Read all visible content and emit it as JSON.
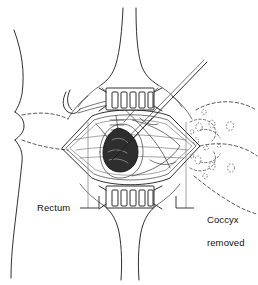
{
  "figure": {
    "domain": "medical-line-drawing",
    "background_color": "#ffffff",
    "line_color": "#1a1a1a",
    "mass_fill_color": "#2e2e2e",
    "dashed_line_color": "#2a2a2a",
    "width": 258,
    "height": 285
  },
  "labels": {
    "rectum": {
      "text": "Rectum",
      "position": "lower-left",
      "leader": "L-shaped leader from text up-right to the dark rectal mass"
    },
    "coccyx_removed": {
      "line1": "Coccyx",
      "line2": "removed",
      "text": "Coccyx removed",
      "position": "lower-right",
      "leader": "L-shaped leader from text up-left to the right side of the incision"
    }
  },
  "anatomy": {
    "body_outline": "left buttock and flank silhouette",
    "gluteal_cleft_upper": "natal cleft descending from top center",
    "gluteal_cleft_lower": "natal cleft continuing below the wound",
    "skin_crease_lines": "two dashed horizontal gluteal fold lines crossing the left body",
    "incision": "diamond / lens-shaped midline posterior incision",
    "rectum_mass": "dark shaded teardrop structure at left of the exposed field",
    "sutures": "short transverse suture ticks above the rectal mass",
    "coccyx_defect": "dashed outline and stippled circles marking the excised coccyx region"
  },
  "instruments": {
    "upper_retractor": {
      "name": "self-retaining retractor",
      "prong_count": 5,
      "location": "superior wound margin"
    },
    "lower_retractor": {
      "name": "self-retaining retractor",
      "prong_count": 5,
      "location": "inferior wound margin"
    },
    "hook_retractor": {
      "name": "curved hook retractor",
      "location": "upper left of wound"
    },
    "probe": {
      "name": "long straight probe / retractor shaft",
      "orientation": "diagonal from upper right to lower left across the field"
    }
  }
}
